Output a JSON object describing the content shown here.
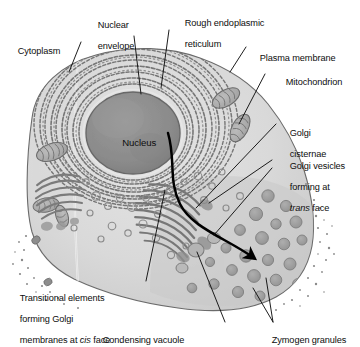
{
  "figure": {
    "type": "labelled-cell-diagram",
    "canvas": {
      "width": 360,
      "height": 347
    }
  },
  "palette": {
    "background": "#ffffff",
    "cytoplasm_light": "#dcdcdc",
    "cytoplasm_mid": "#cfcfcf",
    "cytoplasm_apex": "#c4c4c4",
    "nucleus_fill": "#8d8d8d",
    "nucleus_rim": "#6f6f6f",
    "er_stroke": "#6b6b6b",
    "golgi_stroke": "#7a7a7a",
    "granule_fill": "#9d9d9d",
    "membrane_stroke": "#5a5a5a",
    "leader_line": "#111111",
    "arrow": "#000000",
    "text": "#0d0d0d"
  },
  "labels": [
    {
      "id": "cytoplasm",
      "text": "Cytoplasm"
    },
    {
      "id": "nuclear-envelope",
      "line1": "Nuclear",
      "line2": "envelope"
    },
    {
      "id": "rough-er",
      "line1": "Rough endoplasmic",
      "line2": "reticulum"
    },
    {
      "id": "plasma-membrane",
      "text": "Plasma membrane"
    },
    {
      "id": "mitochondrion",
      "text": "Mitochondrion"
    },
    {
      "id": "golgi-cisternae",
      "line1": "Golgi",
      "line2": "cisternae"
    },
    {
      "id": "golgi-vesicles",
      "line1": "Golgi vesicles",
      "line2": "forming at",
      "line3_italic": "trans",
      "line3_rest": " face"
    },
    {
      "id": "transitional-elements",
      "line1": "Transitional elements",
      "line2": "forming Golgi",
      "line3_pre": "membranes at ",
      "line3_italic": "cis",
      "line3_rest": " face"
    },
    {
      "id": "condensing-vacuole",
      "text": "Condensing vacuole"
    },
    {
      "id": "zymogen-granules",
      "text": "Zymogen granules"
    }
  ],
  "structures": {
    "nucleus_label": "Nucleus",
    "organelles": [
      {
        "name": "nucleus",
        "count": 1
      },
      {
        "name": "rough-endoplasmic-reticulum",
        "count": 1,
        "note": "concentric ribosome-studded lamellae around nucleus"
      },
      {
        "name": "mitochondrion",
        "count": 5
      },
      {
        "name": "golgi-apparatus",
        "count": 2,
        "note": "fan of curved cisternae"
      },
      {
        "name": "zymogen-granule",
        "count": 22
      },
      {
        "name": "condensing-vacuole",
        "count": 3
      },
      {
        "name": "transport-vesicle",
        "count": 24
      },
      {
        "name": "microvilli-stipple",
        "count": 2,
        "note": "apical and basolateral border"
      }
    ],
    "transport_arrow": {
      "name": "secretory-pathway-arrow",
      "description": "curved black arrow from rough ER through Golgi to apical zymogen granules"
    }
  }
}
